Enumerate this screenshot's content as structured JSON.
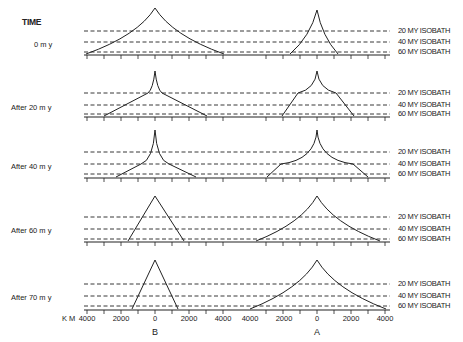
{
  "header": {
    "time_label": "TIME"
  },
  "panels": [
    {
      "label": "0 m y",
      "baseline_y": 55,
      "iso_y": [
        31,
        42,
        52
      ],
      "B": {
        "peak_y": 8,
        "left_x": 86,
        "right_x": 224,
        "curve": "concave"
      },
      "A": {
        "peak_y": 10,
        "left_x": 290,
        "right_x": 338,
        "curve": "concave"
      }
    },
    {
      "label": "After  20 m y",
      "baseline_y": 117,
      "iso_y": [
        93,
        105,
        114
      ],
      "B": {
        "peak_y": 71,
        "left_x": 104,
        "right_x": 207,
        "shoulder_y": 93,
        "shoulder_dx": 7
      },
      "A": {
        "peak_y": 71,
        "left_x": 282,
        "right_x": 354,
        "shoulder_y": 93,
        "shoulder_dx": 19
      }
    },
    {
      "label": "After  40 m y",
      "baseline_y": 178,
      "iso_y": [
        152,
        164,
        174
      ],
      "B": {
        "peak_y": 130,
        "left_x": 116,
        "right_x": 196,
        "shoulder_y": 164,
        "shoulder_dx": 14
      },
      "A": {
        "peak_y": 130,
        "left_x": 267,
        "right_x": 368,
        "shoulder_y": 164,
        "shoulder_dx": 36
      }
    },
    {
      "label": "After  60 m y",
      "baseline_y": 242,
      "iso_y": [
        217,
        229,
        239
      ],
      "B": {
        "peak_y": 196,
        "left_x": 128,
        "right_x": 184,
        "curve": "straight"
      },
      "A": {
        "peak_y": 196,
        "left_x": 256,
        "right_x": 380,
        "curve": "concave"
      }
    },
    {
      "label": "After  70 m y",
      "baseline_y": 310,
      "iso_y": [
        284,
        296,
        306
      ],
      "B": {
        "peak_y": 260,
        "left_x": 132,
        "right_x": 178,
        "curve": "straight"
      },
      "A": {
        "peak_y": 260,
        "left_x": 250,
        "right_x": 386,
        "curve": "concave"
      }
    }
  ],
  "isobaths": [
    "20 MY  ISOBATH",
    "40 MY  ISOBATH",
    "60 MY  ISOBATH"
  ],
  "axis": {
    "unit": "K M",
    "B_ticks": [
      "4000",
      "2000",
      "0",
      "2000",
      "4000"
    ],
    "A_ticks": [
      "4000",
      "2000",
      "0",
      "2000",
      "4000"
    ],
    "B_center_x": 155,
    "A_center_x": 317,
    "px_per_1000km": 17
  },
  "sites": {
    "B": "B",
    "A": "A"
  },
  "colors": {
    "ink": "#222222",
    "paper": "#ffffff"
  }
}
